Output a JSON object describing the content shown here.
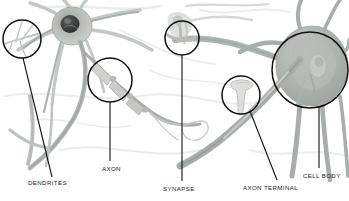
{
  "figure": {
    "background_color": "#ffffff",
    "line_color": "#111111",
    "tissue_color_light": "#d8dad6",
    "tissue_color_mid": "#a9aeab",
    "tissue_color_dark": "#6e736f",
    "nucleus_color": "#3a3d3b",
    "width": 349,
    "height": 201
  },
  "labels": {
    "dendrites": "DENDRITES",
    "axon": "AXON",
    "synapse": "SYNAPSE",
    "axon_terminal": "AXON TERMINAL",
    "cell_body": "CELL BODY"
  },
  "callouts": [
    {
      "name": "dendrites",
      "cx": 22,
      "cy": 39,
      "r": 19,
      "leader_from": [
        23,
        58
      ],
      "leader_to": [
        52,
        177
      ]
    },
    {
      "name": "axon",
      "cx": 110,
      "cy": 80,
      "r": 22,
      "leader_from": [
        110,
        102
      ],
      "leader_to": [
        110,
        161
      ]
    },
    {
      "name": "synapse",
      "cx": 182,
      "cy": 38,
      "r": 17,
      "leader_from": [
        182,
        55
      ],
      "leader_to": [
        182,
        181
      ]
    },
    {
      "name": "axon-terminal",
      "cx": 241,
      "cy": 95,
      "r": 19,
      "leader_from": [
        250,
        111
      ],
      "leader_to": [
        277,
        180
      ]
    },
    {
      "name": "cell-body",
      "cx": 310,
      "cy": 70,
      "r": 38,
      "leader_from": [
        319,
        107
      ],
      "leader_to": [
        319,
        168
      ]
    }
  ]
}
